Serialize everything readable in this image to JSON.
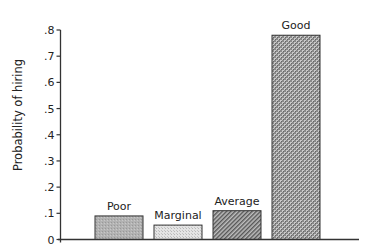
{
  "chart_data": {
    "type": "bar",
    "title": "",
    "xlabel": "",
    "ylabel": "Probability of hiring",
    "categories": [
      "Poor",
      "Marginal",
      "Average",
      "Good"
    ],
    "values": [
      0.09,
      0.055,
      0.11,
      0.78
    ],
    "ylim": [
      0,
      0.8
    ],
    "yticks": [
      0,
      0.1,
      0.2,
      0.3,
      0.4,
      0.5,
      0.6,
      0.7,
      0.8
    ],
    "ytick_labels": [
      "0",
      ".1",
      ".2",
      ".3",
      ".4",
      ".5",
      ".6",
      ".7",
      ".8"
    ],
    "grid": false,
    "legend": null,
    "bar_labels_above": true,
    "bar_fills": [
      "medium-gray-stipple",
      "light-dotted",
      "dark-diagonal-hatch",
      "dark-checker"
    ]
  },
  "colors": {
    "axis": "#333333",
    "text": "#222222",
    "bar_outline": "#333333"
  }
}
